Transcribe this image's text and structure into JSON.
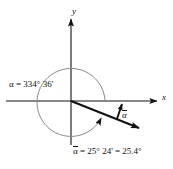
{
  "figure": {
    "type": "angle-standard-position-diagram",
    "width": 173,
    "height": 169,
    "background_color": "#ffffff"
  },
  "axes": {
    "x_label": "x",
    "y_label": "y",
    "origin": {
      "x": 71,
      "y": 101
    },
    "color": "#111111"
  },
  "arc": {
    "description": "counterclockwise sweep arc",
    "color": "#8a8a8a",
    "radius": 34,
    "sweep_degrees": "334° 36'"
  },
  "rays": {
    "terminal_side_color": "#111111",
    "reference_arrow_color": "#111111"
  },
  "labels": {
    "angle": {
      "symbol": "α",
      "text": "α = 334° 36'",
      "value_degrees": 334,
      "value_minutes": 36
    },
    "reference_angle_marker": {
      "symbol": "α",
      "overline": true
    },
    "reference_angle": {
      "prefix": "α",
      "text": " = 25° 24' = 25.4°",
      "full_text": "α = 25° 24' = 25.4°",
      "value_degrees": 25,
      "value_minutes": 24,
      "value_decimal_degrees": 25.4
    }
  }
}
